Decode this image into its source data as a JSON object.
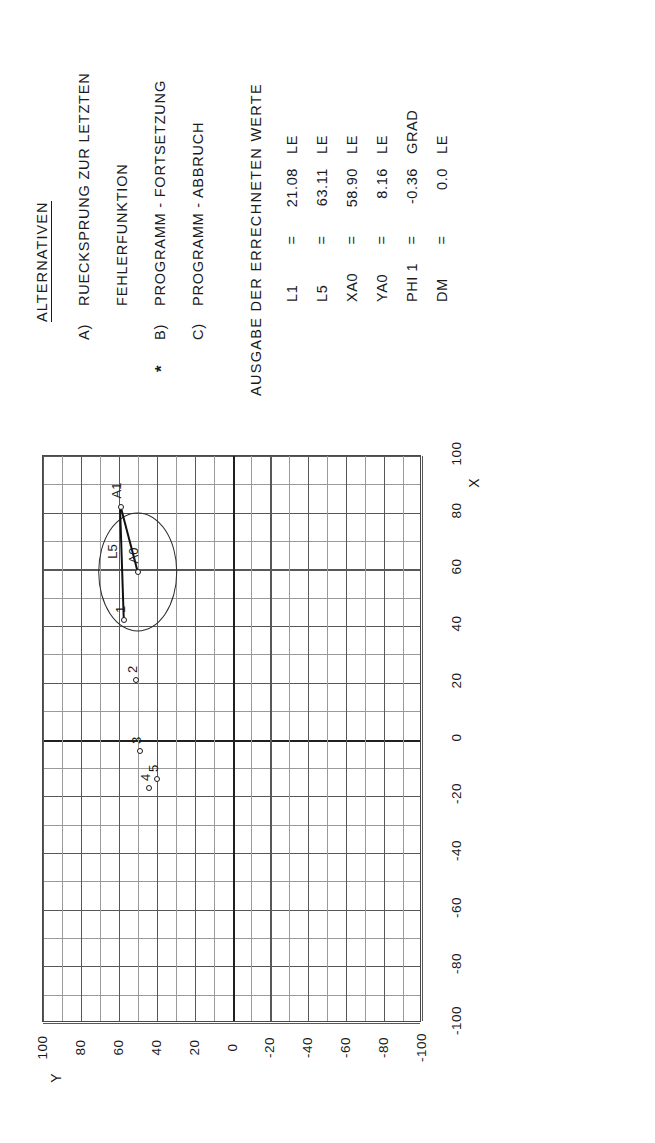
{
  "alternatives": {
    "title": "ALTERNATIVEN",
    "star_marker": "*",
    "rows": [
      {
        "key": "A)",
        "text": "RUECKSPRUNG  ZUR  LETZTEN",
        "starred": false
      },
      {
        "key": "",
        "text": "FEHLERFUNKTION",
        "starred": false
      },
      {
        "key": "B)",
        "text": "PROGRAMM - FORTSETZUNG",
        "starred": true
      },
      {
        "key": "C)",
        "text": "PROGRAMM - ABBRUCH",
        "starred": false
      }
    ]
  },
  "output": {
    "title": "AUSGABE  DER  ERRECHNETEN  WERTE",
    "values": [
      {
        "name": "L1",
        "eq": "=",
        "value": "21.08",
        "unit": "LE"
      },
      {
        "name": "L5",
        "eq": "=",
        "value": "63.11",
        "unit": "LE"
      },
      {
        "name": "XA0",
        "eq": "=",
        "value": "58.90",
        "unit": "LE"
      },
      {
        "name": "YA0",
        "eq": "=",
        "value": "8.16",
        "unit": "LE"
      },
      {
        "name": "PHI 1",
        "eq": "=",
        "value": "-0.36",
        "unit": "GRAD"
      },
      {
        "name": "DM",
        "eq": "=",
        "value": "0.0",
        "unit": "LE"
      }
    ]
  },
  "chart_data": {
    "type": "scatter",
    "title": "",
    "xlabel": "X",
    "ylabel": "Y",
    "xlim": [
      -100,
      100
    ],
    "ylim": [
      -100,
      100
    ],
    "xticks": [
      -100,
      -80,
      -60,
      -40,
      -20,
      0,
      20,
      40,
      60,
      80,
      100
    ],
    "yticks": [
      100,
      80,
      60,
      40,
      20,
      0,
      -20,
      -40,
      -60,
      -80,
      -100
    ],
    "xtick_labels": [
      "-100",
      "-80",
      "-60",
      "-40",
      "-20",
      "0",
      "20",
      "40",
      "60",
      "80",
      "100"
    ],
    "ytick_labels": [
      "100",
      "80",
      "60",
      "40",
      "20",
      "0",
      "-20",
      "-40",
      "-60",
      "-80",
      "-100"
    ],
    "grid": true,
    "grid_minor_step": 10,
    "grid_major_step": 20,
    "legend": "none",
    "points": [
      {
        "label": "1",
        "x": 42,
        "y": 57
      },
      {
        "label": "2",
        "x": 21,
        "y": 51
      },
      {
        "label": "3",
        "x": -4,
        "y": 49
      },
      {
        "label": "4",
        "x": -17,
        "y": 44
      },
      {
        "label": "5",
        "x": -14,
        "y": 40
      },
      {
        "label": "A1",
        "x": 82,
        "y": 59
      },
      {
        "label": "A0",
        "x": 59,
        "y": 50
      }
    ],
    "segments": [
      {
        "label": "L5",
        "from": "1",
        "to": "A1"
      },
      {
        "label": "",
        "from": "A0",
        "to": "A1"
      }
    ],
    "circle": {
      "center_label": "A0",
      "center_x": 59,
      "center_y": 50,
      "radius": 21
    },
    "annotations": [
      "L5",
      "A0",
      "A1"
    ]
  }
}
